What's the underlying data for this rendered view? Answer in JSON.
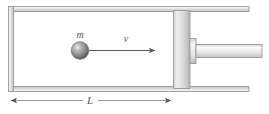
{
  "figure": {
    "type": "physics-diagram",
    "width": 269,
    "height": 114,
    "background_color": "#ffffff"
  },
  "labels": {
    "mass": "m",
    "velocity": "v",
    "length": "L"
  },
  "colors": {
    "outline": "#9a9a9c",
    "outline_dark": "#6d6d70",
    "wall_fill_light": "#f2f2f2",
    "wall_fill_mid": "#c9c9cb",
    "piston_light": "#e6e6e7",
    "piston_mid": "#bdbdbf",
    "rod_light": "#fbfbfb",
    "rod_mid": "#d2d2d4",
    "ball_highlight": "#e8e8ea",
    "ball_mid": "#9d9da0",
    "ball_dark": "#5f5f62",
    "arrow": "#58585a",
    "text": "#58585a"
  },
  "geometry": {
    "cylinder": {
      "outer_left": 8,
      "outer_top": 6,
      "outer_right": 249,
      "outer_bottom": 92,
      "wall_thickness": 5
    },
    "piston": {
      "x": 173,
      "y": 10,
      "width": 17,
      "height": 78
    },
    "collar": {
      "x": 190,
      "y": 38,
      "width": 6,
      "height": 26
    },
    "rod": {
      "x": 196,
      "y": 44,
      "width": 66,
      "height": 14
    },
    "ball": {
      "cx": 80,
      "cy": 50,
      "r": 9
    },
    "velocity_arrow": {
      "x1": 89,
      "x2": 157,
      "y": 50
    },
    "dimension_line": {
      "x1": 9,
      "x2": 174,
      "y": 100,
      "label_x": 90
    }
  },
  "parts": [
    {
      "name": "cylinder-top-wall",
      "label": "Top wall of cylinder"
    },
    {
      "name": "cylinder-bottom-wall",
      "label": "Bottom wall of cylinder"
    },
    {
      "name": "cylinder-left-wall",
      "label": "Closed left end of cylinder"
    },
    {
      "name": "piston",
      "label": "Piston"
    },
    {
      "name": "piston-rod",
      "label": "Piston rod"
    },
    {
      "name": "ball",
      "label": "Ball of mass m"
    },
    {
      "name": "velocity-arrow",
      "label": "Velocity vector v"
    },
    {
      "name": "length-dimension",
      "label": "Length dimension L"
    }
  ]
}
